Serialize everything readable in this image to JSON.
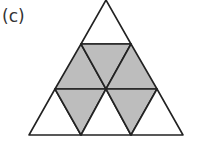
{
  "figure": {
    "label": "(c)",
    "colors": {
      "shaded": "#bdbdbd",
      "unshaded": "#ffffff",
      "stroke": "#222222"
    },
    "triangles": [
      {
        "row": 0,
        "orientation": "up",
        "points": "106,0 81,44 131,44",
        "shaded": false
      },
      {
        "row": 1,
        "orientation": "up",
        "points": "81,44 55,89 106,89",
        "shaded": true
      },
      {
        "row": 1,
        "orientation": "down",
        "points": "81,44 131,44 106,89",
        "shaded": true
      },
      {
        "row": 1,
        "orientation": "up",
        "points": "131,44 106,89 157,89",
        "shaded": true
      },
      {
        "row": 2,
        "orientation": "up",
        "points": "55,89 29,135 81,135",
        "shaded": false
      },
      {
        "row": 2,
        "orientation": "down",
        "points": "55,89 106,89 81,135",
        "shaded": true
      },
      {
        "row": 2,
        "orientation": "up",
        "points": "106,89 81,135 131,135",
        "shaded": false
      },
      {
        "row": 2,
        "orientation": "down",
        "points": "106,89 157,89 131,135",
        "shaded": true
      },
      {
        "row": 2,
        "orientation": "up",
        "points": "157,89 131,135 183,135",
        "shaded": false
      }
    ]
  }
}
